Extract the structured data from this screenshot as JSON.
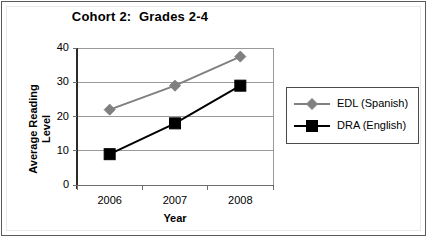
{
  "chart_data": {
    "type": "line",
    "title": "Cohort 2:  Grades 2-4",
    "xlabel": "Year",
    "ylabel": "Average Reading Level",
    "ylabel_line1": "Average Reading",
    "ylabel_line2": "Level",
    "categories": [
      "2006",
      "2007",
      "2008"
    ],
    "ylim": [
      0,
      40
    ],
    "yticks": [
      "0",
      "10",
      "20",
      "30",
      "40"
    ],
    "ytick_values": [
      0,
      10,
      20,
      30,
      40
    ],
    "grid": "horizontal",
    "legend_position": "right",
    "series": [
      {
        "name": "EDL (Spanish)",
        "values": [
          22,
          29,
          37.5
        ],
        "color": "#808080",
        "marker": "diamond"
      },
      {
        "name": "DRA (English)",
        "values": [
          9,
          18,
          29
        ],
        "color": "#000000",
        "marker": "square"
      }
    ]
  },
  "legend": {
    "items": [
      {
        "label": "EDL (Spanish)"
      },
      {
        "label": "DRA (English)"
      }
    ]
  },
  "colors": {
    "edl": "#808080",
    "dra": "#000000",
    "grid": "#9a9a9a",
    "axis": "#6e6e6e",
    "frame": "#5a5a5a"
  }
}
